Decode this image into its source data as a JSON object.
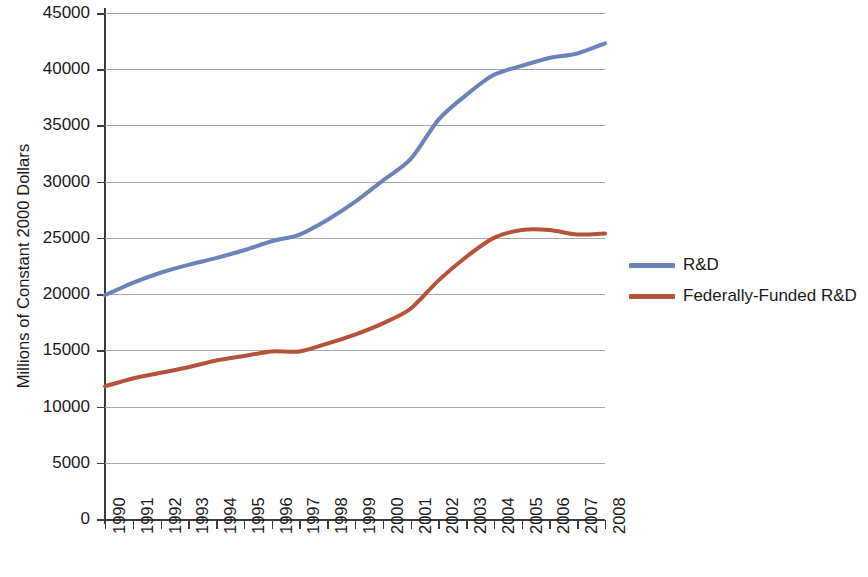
{
  "chart_data": {
    "type": "line",
    "title": "",
    "xlabel": "",
    "ylabel": "Millions of Constant 2000 Dollars",
    "x": [
      "1990",
      "1991",
      "1992",
      "1993",
      "1994",
      "1995",
      "1996",
      "1997",
      "1998",
      "1999",
      "2000",
      "2001",
      "2002",
      "2003",
      "2004",
      "2005",
      "2006",
      "2007",
      "2008"
    ],
    "categories": [
      "1990",
      "1991",
      "1992",
      "1993",
      "1994",
      "1995",
      "1996",
      "1997",
      "1998",
      "1999",
      "2000",
      "2001",
      "2002",
      "2003",
      "2004",
      "2005",
      "2006",
      "2007",
      "2008"
    ],
    "series": [
      {
        "name": "R&D",
        "color": "#6c82b8",
        "values": [
          19900,
          21000,
          21900,
          22600,
          23200,
          23900,
          24700,
          25300,
          26600,
          28200,
          30100,
          32000,
          35500,
          37700,
          39500,
          40300,
          41000,
          41400,
          42300
        ]
      },
      {
        "name": "Federally-Funded R&D",
        "color": "#b4523b",
        "values": [
          11800,
          12500,
          13000,
          13500,
          14100,
          14500,
          14900,
          14900,
          15600,
          16400,
          17400,
          18700,
          21200,
          23300,
          25000,
          25700,
          25700,
          25300,
          25400
        ]
      }
    ],
    "ylim": [
      0,
      45000
    ],
    "yticks": [
      0,
      5000,
      10000,
      15000,
      20000,
      25000,
      30000,
      35000,
      40000,
      45000
    ],
    "ytick_labels": [
      "0",
      "5000",
      "10000",
      "15000",
      "20000",
      "25000",
      "30000",
      "35000",
      "40000",
      "45000"
    ],
    "grid": "horizontal",
    "legend_position": "right",
    "annotations": []
  },
  "legend": {
    "entries": [
      {
        "label": "R&D",
        "color": "#6c82b8"
      },
      {
        "label": "Federally-Funded R&D",
        "color": "#b4523b"
      }
    ]
  },
  "axis": {
    "y_title": "Millions of Constant 2000 Dollars"
  }
}
